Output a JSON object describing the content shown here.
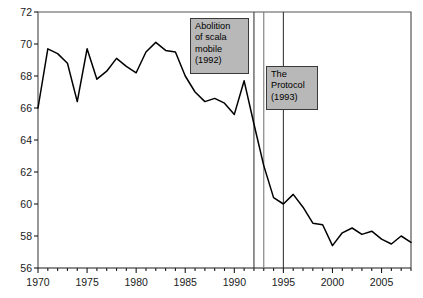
{
  "chart_data": {
    "type": "line",
    "title": "",
    "subtitle": "",
    "xlabel": "",
    "ylabel": "",
    "xlim": [
      1970,
      2008
    ],
    "ylim": [
      56,
      72
    ],
    "ytick_step": 2,
    "xtick_step": 1,
    "xtick_label_step": 5,
    "grid": false,
    "legend": "none",
    "yticks": [
      56,
      58,
      60,
      62,
      64,
      66,
      68,
      70,
      72
    ],
    "ytick_labels": [
      "56",
      "58",
      "60",
      "62",
      "64",
      "66",
      "68",
      "70",
      "72"
    ],
    "xticks": [
      1970,
      1971,
      1972,
      1973,
      1974,
      1975,
      1976,
      1977,
      1978,
      1979,
      1980,
      1981,
      1982,
      1983,
      1984,
      1985,
      1986,
      1987,
      1988,
      1989,
      1990,
      1991,
      1992,
      1993,
      1994,
      1995,
      1996,
      1997,
      1998,
      1999,
      2000,
      2001,
      2002,
      2003,
      2004,
      2005,
      2006,
      2007,
      2008
    ],
    "xtick_labels": [
      "1970",
      "1975",
      "1980",
      "1985",
      "1990",
      "1995",
      "2000",
      "2005"
    ],
    "xtick_label_years": [
      1970,
      1975,
      1980,
      1985,
      1990,
      1995,
      2000,
      2005
    ],
    "series": [
      {
        "name": "Wage share",
        "color": "#000000",
        "x": [
          1970,
          1971,
          1972,
          1973,
          1974,
          1975,
          1976,
          1977,
          1978,
          1979,
          1980,
          1981,
          1982,
          1983,
          1984,
          1985,
          1986,
          1987,
          1988,
          1989,
          1990,
          1991,
          1992,
          1993,
          1994,
          1995,
          1996,
          1997,
          1998,
          1999,
          2000,
          2001,
          2002,
          2003,
          2004,
          2005,
          2006,
          2007,
          2008
        ],
        "values": [
          66.0,
          69.7,
          69.4,
          68.8,
          66.4,
          69.7,
          67.8,
          68.3,
          69.1,
          68.6,
          68.2,
          69.5,
          70.1,
          69.6,
          69.5,
          68.0,
          67.0,
          66.4,
          66.6,
          66.3,
          65.6,
          67.7,
          65.0,
          62.4,
          60.4,
          60.0,
          60.6,
          59.8,
          58.8,
          58.7,
          57.4,
          58.2,
          58.5,
          58.1,
          58.3,
          57.8,
          57.5,
          58.0,
          57.6
        ]
      }
    ],
    "annotations": [
      {
        "id": "abolition-scala-mobile",
        "text": "Abolition\nof scala\nmobile\n(1992)",
        "year": 1992,
        "vline_year": 1992,
        "box_fill": "#b8b8b8",
        "box_border": "#3a3a3a"
      },
      {
        "id": "the-protocol",
        "text": "The\nProtocol\n(1993)",
        "year": 1993,
        "vline_year": 1993,
        "box_fill": "#b8b8b8",
        "box_border": "#3a3a3a"
      }
    ],
    "vlines": [
      {
        "year": 1992,
        "color": "#3a3a3a"
      },
      {
        "year": 1993,
        "color": "#7a7a7a"
      },
      {
        "year": 1995,
        "color": "#3a3a3a"
      }
    ],
    "axis_color": "#555555",
    "line_color": "#000000",
    "background": "#ffffff"
  },
  "annotation_boxes": {
    "abolition": {
      "line1": "Abolition",
      "line2": "of scala",
      "line3": "mobile",
      "line4": "(1992)",
      "text": "Abolition\nof scala\nmobile\n(1992)"
    },
    "protocol": {
      "line1": "The",
      "line2": "Protocol",
      "line3": "(1993)",
      "text": "The\nProtocol\n(1993)"
    }
  }
}
